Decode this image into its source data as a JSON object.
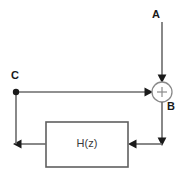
{
  "diagram": {
    "type": "signal-flow-block-diagram",
    "background_color": "#ffffff",
    "wire_color": "#6b6b6b",
    "label_color": "#1a1a1a",
    "block_border_color": "#5f5f5f",
    "summing_junction": {
      "label": "+",
      "sign": "+",
      "center_x": 162,
      "center_y": 92,
      "radius": 10,
      "stroke_color": "#8a8a8a"
    },
    "nodes": [
      {
        "id": "A",
        "label": "A",
        "role": "input-signal",
        "x": 155,
        "y": 14
      },
      {
        "id": "B",
        "label": "B",
        "role": "summing-junction-output",
        "x": 170,
        "y": 107
      },
      {
        "id": "C",
        "label": "C",
        "role": "branch-node-output",
        "x": 14,
        "y": 76,
        "has_junction_dot": true,
        "dot_x": 16,
        "dot_y": 92
      }
    ],
    "blocks": [
      {
        "id": "Hz",
        "label": "H(z)",
        "role": "transfer-function-block",
        "x": 46,
        "y": 122,
        "width": 82,
        "height": 45
      }
    ],
    "connections": [
      {
        "from": "A",
        "to": "summing_junction",
        "direction": "down",
        "arrow": true
      },
      {
        "from": "C",
        "to": "summing_junction",
        "direction": "right",
        "arrow": true
      },
      {
        "from": "summing_junction",
        "to": "Hz",
        "direction": "down-then-left",
        "arrow": true
      },
      {
        "from": "Hz",
        "to": "C",
        "direction": "left-then-up",
        "arrow": true
      }
    ]
  }
}
